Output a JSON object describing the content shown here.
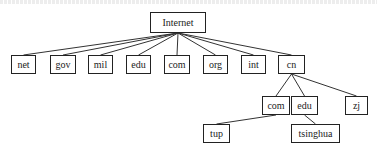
{
  "diagram": {
    "type": "tree",
    "root": {
      "id": "internet",
      "label": "Internet"
    },
    "nodes": [
      {
        "id": "internet",
        "label": "Internet",
        "x": 150,
        "y": 12,
        "w": 56,
        "h": 21
      },
      {
        "id": "net",
        "label": "net",
        "x": 11,
        "y": 55,
        "w": 25,
        "h": 19
      },
      {
        "id": "gov",
        "label": "gov",
        "x": 50,
        "y": 55,
        "w": 26,
        "h": 19
      },
      {
        "id": "mil",
        "label": "mil",
        "x": 88,
        "y": 55,
        "w": 25,
        "h": 19
      },
      {
        "id": "edu",
        "label": "edu",
        "x": 126,
        "y": 55,
        "w": 25,
        "h": 19
      },
      {
        "id": "com",
        "label": "com",
        "x": 164,
        "y": 55,
        "w": 26,
        "h": 19
      },
      {
        "id": "org",
        "label": "org",
        "x": 203,
        "y": 55,
        "w": 25,
        "h": 19
      },
      {
        "id": "int",
        "label": "int",
        "x": 241,
        "y": 55,
        "w": 25,
        "h": 19
      },
      {
        "id": "cn",
        "label": "cn",
        "x": 278,
        "y": 55,
        "w": 27,
        "h": 19
      },
      {
        "id": "cn-com",
        "label": "com",
        "x": 262,
        "y": 96,
        "w": 28,
        "h": 19
      },
      {
        "id": "cn-edu",
        "label": "edu",
        "x": 291,
        "y": 96,
        "w": 27,
        "h": 19
      },
      {
        "id": "cn-zj",
        "label": "zj",
        "x": 345,
        "y": 96,
        "w": 23,
        "h": 19
      },
      {
        "id": "tup",
        "label": "tup",
        "x": 203,
        "y": 124,
        "w": 27,
        "h": 19
      },
      {
        "id": "tsinghua",
        "label": "tsinghua",
        "x": 291,
        "y": 124,
        "w": 49,
        "h": 19
      }
    ],
    "edges": [
      [
        "internet",
        "net"
      ],
      [
        "internet",
        "gov"
      ],
      [
        "internet",
        "mil"
      ],
      [
        "internet",
        "edu"
      ],
      [
        "internet",
        "com"
      ],
      [
        "internet",
        "org"
      ],
      [
        "internet",
        "int"
      ],
      [
        "internet",
        "cn"
      ],
      [
        "cn",
        "cn-com"
      ],
      [
        "cn",
        "cn-edu"
      ],
      [
        "cn",
        "cn-zj"
      ],
      [
        "cn-com",
        "tup"
      ],
      [
        "cn-edu",
        "tsinghua"
      ]
    ],
    "colors": {
      "line": "#333333",
      "border": "#222222",
      "text": "#222222",
      "background": "#ffffff"
    }
  }
}
